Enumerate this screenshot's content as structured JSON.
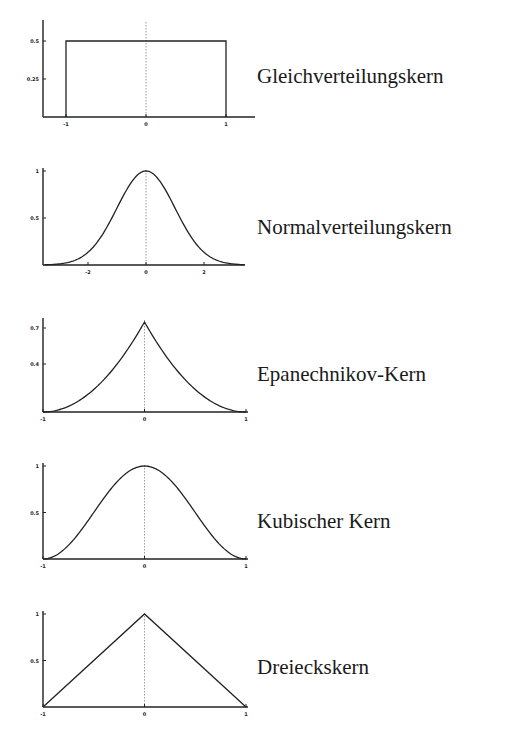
{
  "chart_data": [
    {
      "type": "line",
      "title": "Gleichverteilungskern",
      "kernel": "uniform",
      "xlabel": "",
      "ylabel": "",
      "x_ticks": [
        -1,
        0,
        1
      ],
      "y_ticks": [
        0.25,
        0.5
      ],
      "xlim": [
        -1.3,
        1.25
      ],
      "ylim": [
        0,
        0.62
      ],
      "x": [
        -1,
        -1,
        1,
        1
      ],
      "y": [
        0,
        0.5,
        0.5,
        0
      ],
      "grid": false,
      "zero_line": "dotted"
    },
    {
      "type": "line",
      "title": "Normalverteilungskern",
      "kernel": "gaussian",
      "xlabel": "",
      "ylabel": "",
      "x_ticks": [
        -2,
        0,
        2
      ],
      "y_ticks": [
        0.5,
        1
      ],
      "xlim": [
        -3.5,
        3.4
      ],
      "ylim": [
        0,
        1.05
      ],
      "x": [
        -3.5,
        -3,
        -2.5,
        -2,
        -1.5,
        -1,
        -0.5,
        0,
        0.5,
        1,
        1.5,
        2,
        2.5,
        3,
        3.4
      ],
      "y": [
        0.002,
        0.011,
        0.044,
        0.135,
        0.325,
        0.607,
        0.882,
        1.0,
        0.882,
        0.607,
        0.325,
        0.135,
        0.044,
        0.011,
        0.003
      ],
      "grid": false,
      "zero_line": "dotted"
    },
    {
      "type": "line",
      "title": "Epanechnikov-Kern",
      "kernel": "epanechnikov",
      "xlabel": "",
      "ylabel": "",
      "x_ticks": [
        -1,
        0,
        1
      ],
      "y_ticks": [
        0.4,
        0.7
      ],
      "xlim": [
        -1,
        1
      ],
      "ylim": [
        0,
        0.8
      ],
      "x": [
        -1,
        -0.75,
        -0.5,
        -0.25,
        0,
        0.25,
        0.5,
        0.75,
        1
      ],
      "y": [
        0,
        0.05,
        0.19,
        0.42,
        0.75,
        0.42,
        0.19,
        0.05,
        0
      ],
      "grid": false,
      "zero_line": "dotted"
    },
    {
      "type": "line",
      "title": "Kubischer Kern",
      "kernel": "cubic",
      "xlabel": "",
      "ylabel": "",
      "x_ticks": [
        -1,
        0,
        1
      ],
      "y_ticks": [
        0.5,
        1
      ],
      "xlim": [
        -1,
        1
      ],
      "ylim": [
        0,
        1.02
      ],
      "x": [
        -1,
        -0.75,
        -0.5,
        -0.25,
        0,
        0.25,
        0.5,
        0.75,
        1
      ],
      "y": [
        0,
        0.16,
        0.5,
        0.84,
        1.0,
        0.84,
        0.5,
        0.16,
        0
      ],
      "grid": false,
      "zero_line": "dotted"
    },
    {
      "type": "line",
      "title": "Dreieckskern",
      "kernel": "triangular",
      "xlabel": "",
      "ylabel": "",
      "x_ticks": [
        -1,
        0,
        1
      ],
      "y_ticks": [
        0.5,
        1
      ],
      "xlim": [
        -1,
        1
      ],
      "ylim": [
        0,
        1.02
      ],
      "x": [
        -1,
        0,
        1
      ],
      "y": [
        0,
        1,
        0
      ],
      "grid": false,
      "zero_line": "dotted"
    }
  ],
  "labels": [
    "Gleichverteilungskern",
    "Normalverteilungskern",
    "Epanechnikov-Kern",
    "Kubischer Kern",
    "Dreieckskern"
  ]
}
